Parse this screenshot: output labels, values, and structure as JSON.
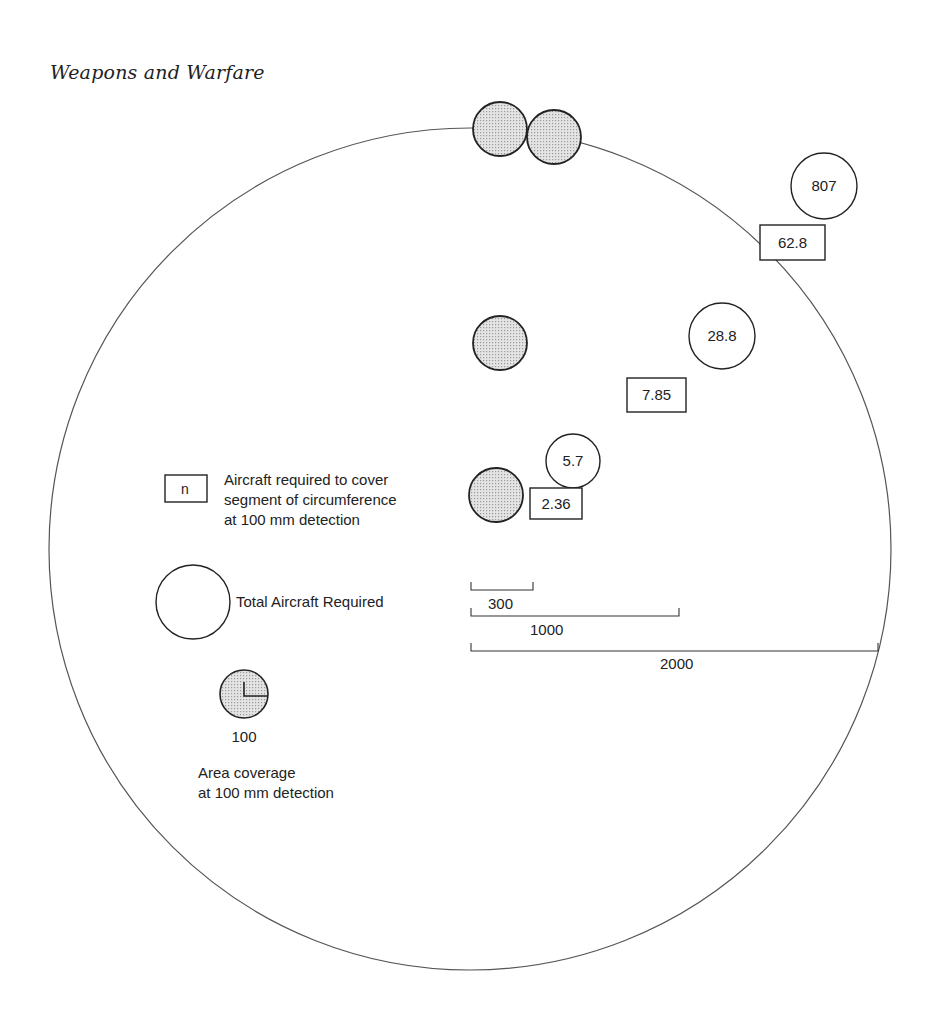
{
  "header": {
    "running_title": "Weapons and Warfare"
  },
  "diagram": {
    "outer_circle": {
      "cx": 470,
      "cy": 549,
      "r": 421
    },
    "colors": {
      "stroke": "#222222",
      "shaded_fill": "#cfcfcf",
      "outer_stroke": "#555555"
    },
    "coverage_circles": [
      {
        "id": "top-left",
        "cx": 500,
        "cy": 129,
        "r": 27
      },
      {
        "id": "top-right",
        "cx": 554,
        "cy": 137,
        "r": 27
      },
      {
        "id": "mid",
        "cx": 500,
        "cy": 343,
        "r": 27
      },
      {
        "id": "lower",
        "cx": 496,
        "cy": 495,
        "r": 27
      }
    ],
    "total_circles": [
      {
        "value": "807",
        "cx": 824,
        "cy": 186,
        "r": 33
      },
      {
        "value": "28.8",
        "cx": 722,
        "cy": 336,
        "r": 33
      },
      {
        "value": "5.7",
        "cx": 573,
        "cy": 461,
        "r": 27
      }
    ],
    "segment_boxes": [
      {
        "value": "62.8",
        "x": 760,
        "y": 225,
        "w": 65,
        "h": 35
      },
      {
        "value": "7.85",
        "x": 627,
        "y": 378,
        "w": 59,
        "h": 34
      },
      {
        "value": "2.36",
        "x": 530,
        "y": 488,
        "w": 52,
        "h": 31
      }
    ],
    "scale_bars": [
      {
        "label": "300",
        "x1": 471,
        "x2": 533,
        "y": 590,
        "label_x": 488,
        "label_y": 609
      },
      {
        "label": "1000",
        "x1": 471,
        "x2": 679,
        "y": 616,
        "label_x": 530,
        "label_y": 635
      },
      {
        "label": "2000",
        "x1": 471,
        "x2": 878,
        "y": 651,
        "label_x": 660,
        "label_y": 669
      }
    ]
  },
  "legend": {
    "segment": {
      "symbol": "n",
      "text_lines": [
        "Aircraft required to cover",
        "segment of circumference",
        "at 100 mm detection"
      ]
    },
    "total": {
      "text": "Total Aircraft Required"
    },
    "area": {
      "radius_label": "100",
      "text_lines": [
        "Area coverage",
        "at 100 mm detection"
      ]
    }
  }
}
